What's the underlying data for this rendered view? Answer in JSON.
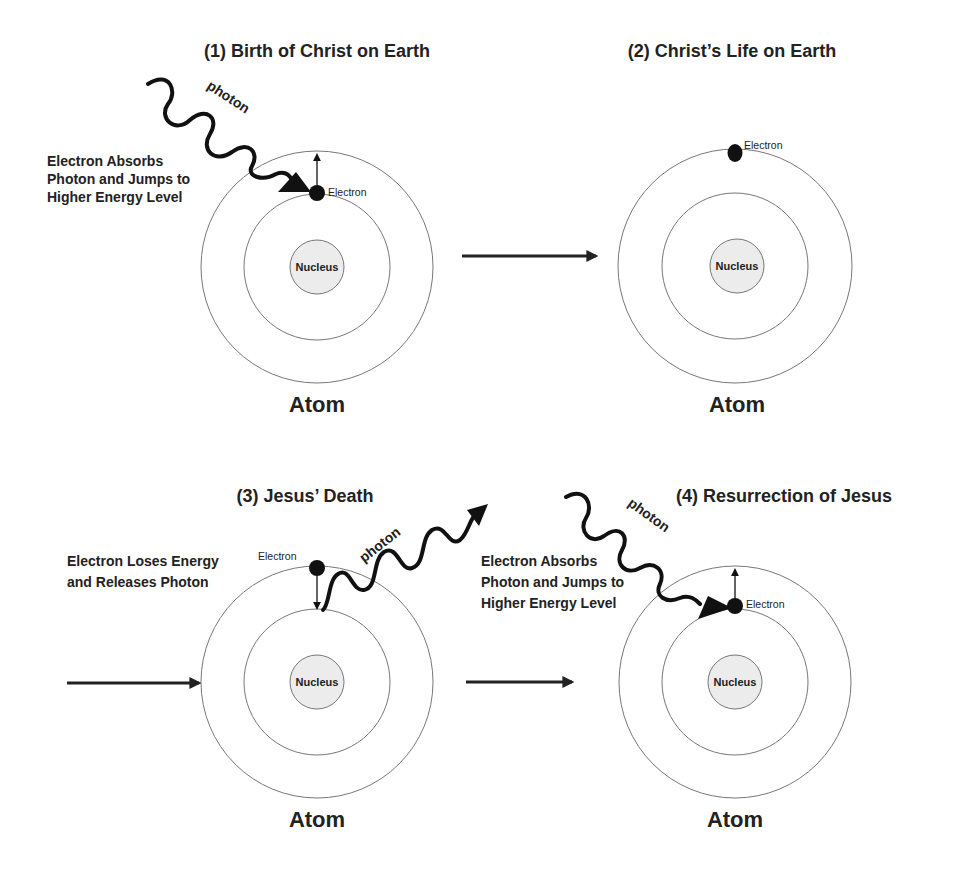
{
  "panels": [
    {
      "id": 1,
      "title": "(1) Birth of Christ on Earth",
      "caption_lines": [
        "Electron Absorbs",
        "Photon and Jumps to",
        "Higher Energy Level"
      ],
      "electron_label": "Electron",
      "nucleus_label": "Nucleus",
      "atom_label": "Atom",
      "photon_label": "photon"
    },
    {
      "id": 2,
      "title": "(2) Christ’s Life on Earth",
      "electron_label": "Electron",
      "nucleus_label": "Nucleus",
      "atom_label": "Atom"
    },
    {
      "id": 3,
      "title": "(3) Jesus’ Death",
      "caption_lines": [
        "Electron Loses Energy",
        "and Releases Photon"
      ],
      "electron_label": "Electron",
      "nucleus_label": "Nucleus",
      "atom_label": "Atom",
      "photon_label": "photon"
    },
    {
      "id": 4,
      "title": "(4) Resurrection of Jesus",
      "caption_lines": [
        "Electron Absorbs",
        "Photon and Jumps to",
        "Higher Energy Level"
      ],
      "electron_label": "Electron",
      "nucleus_label": "Nucleus",
      "atom_label": "Atom",
      "photon_label": "photon"
    }
  ],
  "flow_arrows": [
    {
      "from": 1,
      "to": 2
    },
    {
      "from": 2,
      "to": 3
    },
    {
      "from": 3,
      "to": 4
    }
  ],
  "colors": {
    "ink": "#111111",
    "orbit": "#777777",
    "nucleus_fill": "#ececec",
    "background": "#ffffff"
  }
}
